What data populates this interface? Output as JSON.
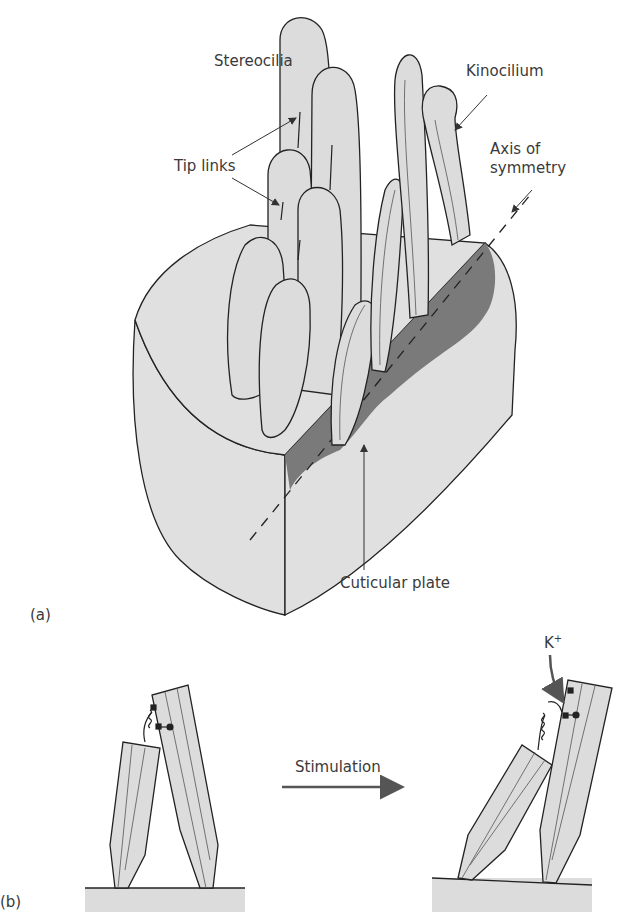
{
  "figure": {
    "panel_a": {
      "label": "(a)",
      "labels": {
        "stereocilia": "Stereocilia",
        "tip_links": "Tip links",
        "kinocilium": "Kinocilium",
        "axis_line1": "Axis of",
        "axis_line2": "symmetry",
        "cuticular_plate": "Cuticular plate"
      }
    },
    "panel_b": {
      "label": "(b)",
      "stimulation": "Stimulation",
      "ion": "K",
      "ion_charge": "+"
    },
    "colors": {
      "fill": "#dcdcdc",
      "cuticular": "#7a7a7a",
      "stroke": "#222222",
      "arrow": "#555555"
    }
  }
}
